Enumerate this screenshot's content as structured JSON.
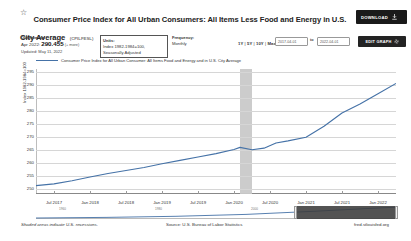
{
  "header": {
    "star_icon": "star-icon",
    "title": "Consumer Price Index for All Urban Consumers: All Items Less Food and Energy in U.S. City Average",
    "series_id": "(CPILFESL)",
    "download_label": "DOWNLOAD",
    "download_icon": "download-icon"
  },
  "meta": {
    "observation_label": "Observation",
    "observation_date": "Apr 2022:",
    "observation_value": "290.455",
    "observation_more": "(+ more)",
    "observation_updated": "Updated: May 11, 2022",
    "units_label": "Units:",
    "units_value": "Index 1982-1984=100,",
    "units_value2": "Seasonally Adjusted",
    "frequency_label": "Frequency:",
    "frequency_value": "Monthly"
  },
  "range": {
    "options": [
      "1Y",
      "5Y",
      "10Y",
      "Max"
    ],
    "separator": "|",
    "date_from": "2017-04-01",
    "date_to": "2022-04-01",
    "to_label": "to",
    "edit_label": "EDIT GRAPH",
    "gear_icon": "gear-icon"
  },
  "footer": {
    "recession_note": "Shaded areas indicate U.S. recessions.",
    "source": "Source: U.S. Bureau of Labor Statistics",
    "fred": "fred.stlouisfed.org"
  },
  "chart_data": {
    "type": "line",
    "title": "Consumer Price Index for All Urban Consumers: All Items Less Food and Energy in U.S. City Average",
    "legend_label": "Consumer Price Index for All Urban Consumer: All Items Food and Energy and in U.S. City Average",
    "legend_position": "top-left",
    "xlabel": "",
    "ylabel": "Index 1982-1984=100",
    "ylim": [
      248,
      296
    ],
    "yticks": [
      250,
      255,
      260,
      265,
      270,
      275,
      280,
      285,
      290,
      295
    ],
    "grid": true,
    "line_color": "#4572a7",
    "recession_color": "#c9c9c9",
    "xticks": [
      "Jul 2017",
      "Jan 2018",
      "Jul 2018",
      "Jan 2019",
      "Jul 2019",
      "Jan 2020",
      "Jul 2020",
      "Jan 2021",
      "Jul 2021",
      "Jan 2022"
    ],
    "xlim": [
      "2017-04-01",
      "2022-04-01"
    ],
    "recessions": [
      {
        "start": "2020-02-01",
        "end": "2020-04-01"
      }
    ],
    "x": [
      "2017-04",
      "2017-07",
      "2017-10",
      "2018-01",
      "2018-04",
      "2018-07",
      "2018-10",
      "2019-01",
      "2019-04",
      "2019-07",
      "2019-10",
      "2020-01",
      "2020-02",
      "2020-04",
      "2020-06",
      "2020-08",
      "2020-10",
      "2021-01",
      "2021-04",
      "2021-07",
      "2021-10",
      "2022-01",
      "2022-04"
    ],
    "values": [
      251.2,
      251.9,
      253.1,
      254.5,
      255.9,
      257.0,
      258.2,
      259.6,
      260.9,
      262.2,
      263.5,
      265.1,
      265.9,
      265.0,
      265.6,
      267.6,
      268.4,
      269.8,
      274.0,
      279.1,
      282.6,
      286.5,
      290.455
    ],
    "last_value": 290.455,
    "last_label": "Apr 2022: 290.455"
  },
  "mininav": {
    "labels": [
      "1960",
      "1980",
      "2000"
    ],
    "selection_start_pct": 72,
    "selection_end_pct": 100
  }
}
